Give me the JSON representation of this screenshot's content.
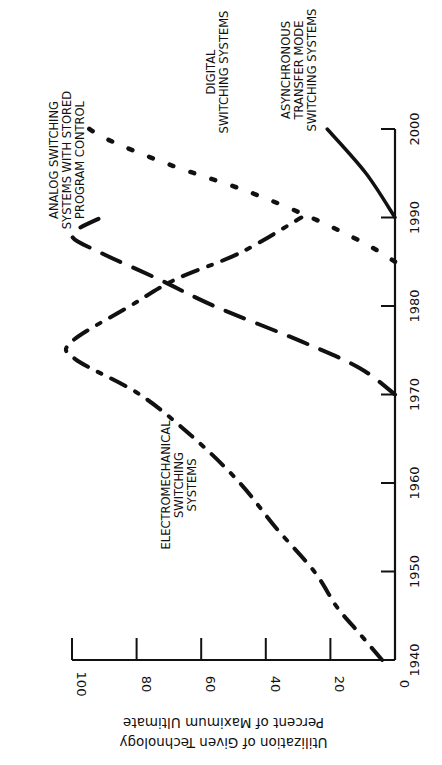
{
  "chart_data": {
    "type": "line",
    "orientation": "rotated-90-clockwise",
    "title": "",
    "xlabel": "",
    "ylabel": "Percent of Maximum Ultimate Utilization of Given Technology",
    "ylabel_lines": [
      "Percent of Maximum Ultimate",
      "Utilization of Given Technology"
    ],
    "xlim": [
      1940,
      2000
    ],
    "ylim": [
      0,
      100
    ],
    "x_ticks": [
      1940,
      1950,
      1960,
      1970,
      1980,
      1990,
      2000
    ],
    "y_ticks": [
      0,
      20,
      40,
      60,
      80,
      100
    ],
    "grid": false,
    "legend": "inline-annotations",
    "series": [
      {
        "name": "Electromechanical Switching Systems",
        "label_lines": [
          "ELECTROMECHANICAL",
          "SWITCHING",
          "SYSTEMS"
        ],
        "style": "dash-dot",
        "x": [
          1940,
          1943,
          1946,
          1950,
          1955,
          1960,
          1965,
          1970,
          1974,
          1976,
          1980,
          1983,
          1986,
          1990
        ],
        "values": [
          4,
          11,
          18,
          25,
          37,
          48,
          62,
          79,
          99,
          100,
          82,
          68,
          48,
          29
        ]
      },
      {
        "name": "Analog Switching Systems with Stored Program Control",
        "label_lines": [
          "ANALOG SWITCHING",
          "SYSTEMS WITH STORED",
          "PROGRAM CONTROL"
        ],
        "style": "long-dash",
        "x": [
          1970,
          1973,
          1976,
          1980,
          1983,
          1986,
          1988,
          1990
        ],
        "values": [
          0,
          11,
          29,
          56,
          73,
          91,
          100,
          91
        ]
      },
      {
        "name": "Digital Switching Systems",
        "label_lines": [
          "DIGITAL",
          "SWITCHING SYSTEMS"
        ],
        "style": "dotted",
        "x": [
          1985,
          1987,
          1990,
          1993,
          1996,
          1999,
          2001
        ],
        "values": [
          0,
          9,
          26,
          46,
          70,
          90,
          98
        ]
      },
      {
        "name": "Asynchronous Transfer Mode Switching Systems",
        "label_lines": [
          "ASYNCHRONOUS",
          "TRANSFER MODE",
          "SWITCHING SYSTEMS"
        ],
        "style": "solid",
        "x": [
          1990,
          1995,
          2000
        ],
        "values": [
          0,
          9,
          21
        ]
      }
    ]
  }
}
